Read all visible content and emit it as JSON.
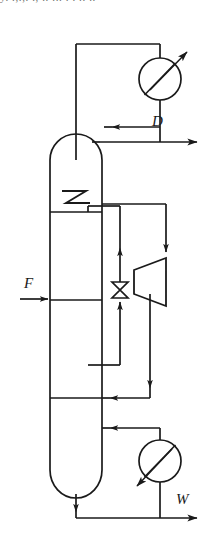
{
  "figure": {
    "kind": "process-flow-diagram",
    "stroke_color": "#1a1a1a",
    "background_color": "#ffffff",
    "cropped_text_fragment": "y.  .,.,.  .,  .. ... .  .    ..  .."
  },
  "labels": {
    "feed": "F",
    "distillate": "D",
    "bottoms": "W"
  },
  "components": [
    {
      "name": "column-shell",
      "label": ""
    },
    {
      "name": "condenser",
      "label": ""
    },
    {
      "name": "reboiler",
      "label": ""
    },
    {
      "name": "side-stripper",
      "label": ""
    },
    {
      "name": "control-valve",
      "label": ""
    },
    {
      "name": "tray-zigzag",
      "label": ""
    }
  ],
  "streams": [
    {
      "name": "feed-stream",
      "label": "F"
    },
    {
      "name": "distillate-stream",
      "label": "D"
    },
    {
      "name": "bottoms-stream",
      "label": "W"
    },
    {
      "name": "reflux-stream",
      "label": ""
    },
    {
      "name": "overhead-vapor-stream",
      "label": ""
    },
    {
      "name": "side-draw-stream",
      "label": ""
    },
    {
      "name": "boilup-return-stream",
      "label": ""
    }
  ]
}
